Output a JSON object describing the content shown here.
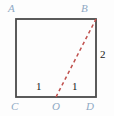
{
  "figure": {
    "type": "geometry-diagram",
    "shape": "square",
    "background_color": "#fdfdfd",
    "stroke_color": "#4a4a4a",
    "vertex_label_color": "#8fa9c4",
    "measure_label_color": "#1a1a1a",
    "dashed_segment_color": "#c0504d",
    "vertices": [
      {
        "name": "A",
        "label": "A",
        "position": "top-left",
        "x": 16,
        "y": 19
      },
      {
        "name": "B",
        "label": "B",
        "position": "top-right",
        "x": 96,
        "y": 19
      },
      {
        "name": "C",
        "label": "C",
        "position": "bottom-left",
        "x": 16,
        "y": 97
      },
      {
        "name": "D",
        "label": "D",
        "position": "bottom-right",
        "x": 96,
        "y": 97
      }
    ],
    "points": [
      {
        "name": "O",
        "label": "O",
        "position": "bottom-edge-midpoint",
        "x": 56,
        "y": 97
      }
    ],
    "measures": [
      {
        "name": "segment-C-O",
        "label": "1",
        "x": 38,
        "y": 86
      },
      {
        "name": "segment-O-D",
        "label": "1",
        "x": 74,
        "y": 86
      },
      {
        "name": "segment-B-D",
        "label": "2",
        "x": 103,
        "y": 55
      }
    ],
    "segments": [
      {
        "name": "side-A-B",
        "from": "A",
        "to": "B",
        "style": "solid"
      },
      {
        "name": "side-B-D",
        "from": "B",
        "to": "D",
        "style": "solid"
      },
      {
        "name": "side-D-C",
        "from": "D",
        "to": "C",
        "style": "solid"
      },
      {
        "name": "side-C-A",
        "from": "C",
        "to": "A",
        "style": "solid"
      },
      {
        "name": "dashed-O-B",
        "from": "O",
        "to": "B",
        "style": "dashed"
      }
    ]
  }
}
